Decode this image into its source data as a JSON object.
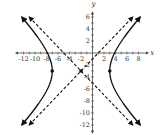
{
  "chart_data": {
    "type": "line",
    "title": "",
    "xlabel": "x",
    "ylabel": "y",
    "xlim": [
      -13,
      9
    ],
    "ylim": [
      -13,
      7
    ],
    "x_ticks": [
      -12,
      -10,
      -8,
      -6,
      -4,
      -2,
      2,
      4,
      6,
      8
    ],
    "y_ticks": [
      6,
      4,
      2,
      -2,
      -4,
      -6,
      -8,
      -10,
      -12
    ],
    "x_tick_labels": [
      "-12",
      "-10",
      "-8",
      "-6",
      "-4",
      "-2",
      "2",
      "4",
      "6",
      "8"
    ],
    "y_tick_labels": [
      "6",
      "4",
      "2",
      "-2",
      "-4",
      "-6",
      "-8",
      "-10",
      "-12"
    ],
    "grid": false,
    "legend": null,
    "center": [
      -2,
      -3
    ],
    "vertices": [
      [
        -7,
        -3
      ],
      [
        3,
        -3
      ]
    ],
    "a": 5,
    "b": 5,
    "series": [
      {
        "name": "hyperbola-left-branch",
        "style": "solid",
        "equation": "(x+2)^2/25 - (y+3)^2/25 = 1",
        "x_range": [
          -11.85,
          -7
        ]
      },
      {
        "name": "hyperbola-right-branch",
        "style": "solid",
        "equation": "(x+2)^2/25 - (y+3)^2/25 = 1",
        "x_range": [
          3,
          7.85
        ]
      },
      {
        "name": "asymptote-positive-slope",
        "style": "dashed",
        "equation": "y = x - 1",
        "points": [
          [
            -11,
            -12
          ],
          [
            7,
            6
          ]
        ]
      },
      {
        "name": "asymptote-negative-slope",
        "style": "dashed",
        "equation": "y = -x - 5",
        "points": [
          [
            -11,
            6
          ],
          [
            7,
            -12
          ]
        ]
      }
    ],
    "marked_points": [
      [
        -7,
        -3
      ],
      [
        -2,
        -3
      ],
      [
        3,
        -3
      ]
    ]
  },
  "labels": {
    "x_axis": "x",
    "y_axis": "y"
  },
  "colors": {
    "curve": "#111111",
    "axis": "#444444"
  }
}
